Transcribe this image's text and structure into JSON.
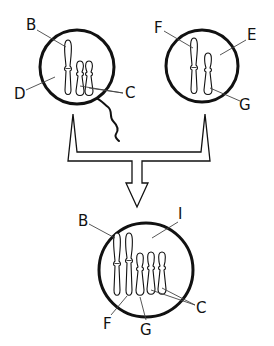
{
  "diagram": {
    "colors": {
      "stroke": "#111111",
      "background": "#ffffff"
    },
    "sperm_cell": {
      "labels": {
        "chromosome_long": "B",
        "cytoplasm": "D",
        "chromosomes_short": "C"
      },
      "chromosome_count": 3,
      "has_tail": true
    },
    "egg_cell": {
      "labels": {
        "chromosome_long": "F",
        "cytoplasm": "E",
        "chromosome_short": "G"
      },
      "chromosome_count": 2
    },
    "zygote": {
      "labels": {
        "chromosome_B": "B",
        "cytoplasm": "I",
        "chromosome_F": "F",
        "chromosome_G": "G",
        "chromosomes_C": "C"
      },
      "chromosome_count": 5
    },
    "connector": {
      "type": "merge-arrow",
      "direction": "down"
    }
  }
}
